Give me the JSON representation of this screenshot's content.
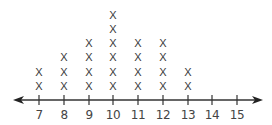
{
  "chart_data": {
    "type": "line-plot",
    "title": "",
    "xlabel": "",
    "ylabel": "",
    "marker": "X",
    "categories": [
      "7",
      "8",
      "9",
      "10",
      "11",
      "12",
      "13",
      "14",
      "15"
    ],
    "values": [
      2,
      3,
      4,
      6,
      4,
      4,
      2,
      0,
      0
    ],
    "xlim": [
      7,
      15
    ],
    "grid": false,
    "legend": null,
    "axis_arrows": "both"
  },
  "colors": {
    "axis": "#333333",
    "marks": "#3a3a3a",
    "labels": "#444444"
  }
}
